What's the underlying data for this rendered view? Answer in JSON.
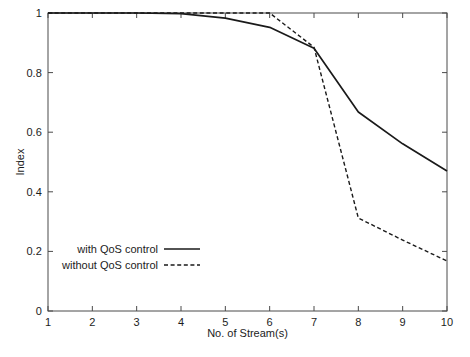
{
  "chart_data": {
    "type": "line",
    "title": "",
    "xlabel": "No. of Stream(s)",
    "ylabel": "Index",
    "xlim": [
      1,
      10
    ],
    "ylim": [
      0,
      1
    ],
    "grid": false,
    "legend_position": "lower-left",
    "x": [
      1,
      2,
      3,
      4,
      5,
      6,
      7,
      8,
      9,
      10
    ],
    "xticks": [
      "1",
      "2",
      "3",
      "4",
      "5",
      "6",
      "7",
      "8",
      "9",
      "10"
    ],
    "yticks": [
      "0",
      "0.2",
      "0.4",
      "0.6",
      "0.8",
      "1"
    ],
    "ytick_values": [
      0,
      0.2,
      0.4,
      0.6,
      0.8,
      1
    ],
    "series": [
      {
        "name": "with QoS control",
        "style": "solid",
        "color": "#1a1a1a",
        "values": [
          1.0,
          1.0,
          1.0,
          0.998,
          0.983,
          0.952,
          0.882,
          0.668,
          0.561,
          0.47
        ]
      },
      {
        "name": "without QoS control",
        "style": "dashed",
        "color": "#1a1a1a",
        "values": [
          1.0,
          1.0,
          1.0,
          1.0,
          1.0,
          1.0,
          0.885,
          0.312,
          0.238,
          0.168
        ]
      }
    ]
  },
  "legend": {
    "entries": [
      {
        "label": "with QoS control",
        "style": "solid"
      },
      {
        "label": "without QoS control",
        "style": "dashed"
      }
    ]
  },
  "axes": {
    "x_axis_label": "No. of Stream(s)",
    "y_axis_label": "Index"
  }
}
